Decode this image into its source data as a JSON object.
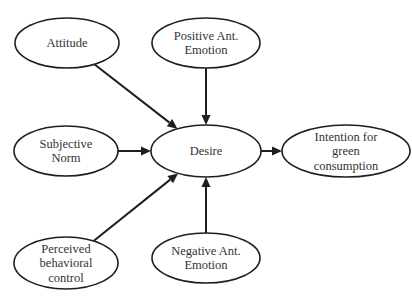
{
  "diagram": {
    "type": "path-model",
    "nodes": [
      {
        "id": "attitude",
        "label_lines": [
          "Attitude"
        ]
      },
      {
        "id": "positive_emotion",
        "label_lines": [
          "Positive Ant.",
          "Emotion"
        ]
      },
      {
        "id": "subjective_norm",
        "label_lines": [
          "Subjective",
          "Norm"
        ]
      },
      {
        "id": "desire",
        "label_lines": [
          "Desire"
        ]
      },
      {
        "id": "intention",
        "label_lines": [
          "Intention for",
          "green",
          "consumption"
        ]
      },
      {
        "id": "perceived_control",
        "label_lines": [
          "Perceived",
          "behavioral",
          "control"
        ]
      },
      {
        "id": "negative_emotion",
        "label_lines": [
          "Negative Ant.",
          "Emotion"
        ]
      }
    ],
    "edges": [
      {
        "from": "attitude",
        "to": "desire"
      },
      {
        "from": "positive_emotion",
        "to": "desire"
      },
      {
        "from": "subjective_norm",
        "to": "desire"
      },
      {
        "from": "perceived_control",
        "to": "desire"
      },
      {
        "from": "negative_emotion",
        "to": "desire"
      },
      {
        "from": "desire",
        "to": "intention"
      }
    ]
  }
}
